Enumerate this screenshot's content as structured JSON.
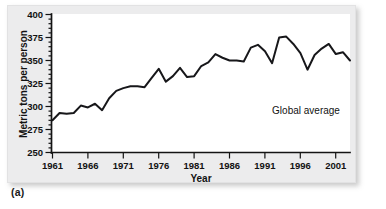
{
  "figure": {
    "caption": "(a)"
  },
  "chart_data": {
    "type": "line",
    "title": "",
    "xlabel": "Year",
    "ylabel": "Metric tons per person",
    "xlim": [
      1961,
      2003
    ],
    "ylim": [
      250,
      400
    ],
    "grid": false,
    "legend_position": "inside-lower-right",
    "annotations": [
      {
        "text": "Global average",
        "x": 1992,
        "y": 292
      }
    ],
    "ytick_labels": [
      "250",
      "275",
      "300",
      "325",
      "350",
      "375",
      "400"
    ],
    "yticks": [
      250,
      275,
      300,
      325,
      350,
      375,
      400
    ],
    "yticks_minor": [
      255,
      260,
      265,
      270,
      280,
      285,
      290,
      295,
      305,
      310,
      315,
      320,
      330,
      335,
      340,
      345,
      355,
      360,
      365,
      370,
      380,
      385,
      390,
      395
    ],
    "xtick_labels": [
      "1961",
      "1966",
      "1971",
      "1976",
      "1981",
      "1986",
      "1991",
      "1996",
      "2001"
    ],
    "xticks": [
      1961,
      1966,
      1971,
      1976,
      1981,
      1986,
      1991,
      1996,
      2001
    ],
    "series": [
      {
        "name": "Global average",
        "color": "#17171a",
        "x": [
          1961,
          1962,
          1963,
          1964,
          1965,
          1966,
          1967,
          1968,
          1969,
          1970,
          1971,
          1972,
          1973,
          1974,
          1975,
          1976,
          1977,
          1978,
          1979,
          1980,
          1981,
          1982,
          1983,
          1984,
          1985,
          1986,
          1987,
          1988,
          1989,
          1990,
          1991,
          1992,
          1993,
          1994,
          1995,
          1996,
          1997,
          1998,
          1999,
          2000,
          2001,
          2002,
          2003
        ],
        "values": [
          285,
          293,
          292,
          293,
          301,
          299,
          303,
          296,
          309,
          317,
          320,
          322,
          322,
          321,
          331,
          341,
          327,
          333,
          342,
          332,
          333,
          344,
          348,
          357,
          353,
          350,
          350,
          349,
          364,
          367,
          360,
          347,
          375,
          376,
          368,
          358,
          340,
          356,
          363,
          368,
          357,
          359,
          350
        ]
      }
    ]
  }
}
